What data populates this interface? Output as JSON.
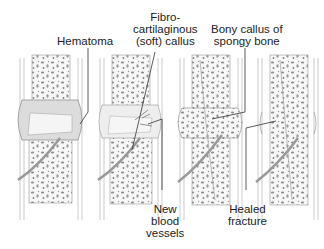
{
  "diagram": {
    "panels": [
      {
        "id": "stage-1",
        "feature": "hematoma"
      },
      {
        "id": "stage-2",
        "feature": "fibrocartilaginous-callus"
      },
      {
        "id": "stage-3",
        "feature": "bony-callus"
      },
      {
        "id": "stage-4",
        "feature": "healed-fracture"
      }
    ],
    "labels": {
      "hematoma": "Hematoma",
      "fibro_line1": "Fibro-",
      "fibro_line2": "cartilaginous",
      "fibro_line3": "(soft) callus",
      "bony_line1": "Bony callus of",
      "bony_line2": "spongy bone",
      "new_line1": "New",
      "new_line2": "blood",
      "new_line3": "vessels",
      "healed_line1": "Healed",
      "healed_line2": "fracture"
    },
    "colors": {
      "line": "#333333",
      "bone_fill": "#f4f4f4",
      "spongy_dots": "#8a8a8a",
      "hematoma": "#d9d9d9",
      "outline": "#9a9a9a"
    }
  }
}
